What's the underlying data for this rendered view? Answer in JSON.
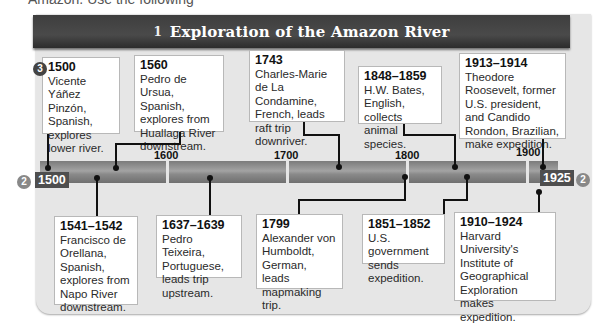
{
  "top_cut_text": "Amazon. Use the following",
  "header": {
    "number": "1",
    "title": "Exploration of the Amazon River"
  },
  "callouts": {
    "three": "3",
    "two_left": "2",
    "two_right": "2"
  },
  "timeline": {
    "start_label": "1500",
    "end_label": "1925",
    "ticks": [
      "1600",
      "1700",
      "1800",
      "1900"
    ]
  },
  "events_top": [
    {
      "year": "1500",
      "text": "Vicente Yáñez Pinzón, Spanish, explores lower river."
    },
    {
      "year": "1560",
      "text": "Pedro de Ursua, Spanish, explores from Huallaga River downstream."
    },
    {
      "year": "1743",
      "text": "Charles-Marie de La Condamine, French, leads raft trip downriver."
    },
    {
      "year": "1848–1859",
      "text": "H.W. Bates, English, collects animal species."
    },
    {
      "year": "1913–1914",
      "text": "Theodore Roosevelt, former U.S. president, and Candido Rondon, Brazilian, make expedition."
    }
  ],
  "events_bottom": [
    {
      "year": "1541–1542",
      "text": "Francisco de Orellana, Spanish, explores from Napo River downstream."
    },
    {
      "year": "1637–1639",
      "text": "Pedro Teixeira, Portuguese, leads trip upstream."
    },
    {
      "year": "1799",
      "text": "Alexander von Humboldt, German, leads mapmaking trip."
    },
    {
      "year": "1851–1852",
      "text": "U.S. government sends expedition."
    },
    {
      "year": "1910–1924",
      "text": "Harvard University's Institute of Geographical Exploration makes expedition."
    }
  ]
}
